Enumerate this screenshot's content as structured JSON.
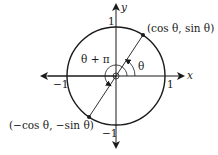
{
  "diagram": {
    "type": "unit-circle",
    "axes": {
      "x_label": "x",
      "y_label": "y"
    },
    "ticks": {
      "x_pos": "1",
      "x_neg": "−1",
      "y_pos": "1",
      "y_neg": "−1"
    },
    "points": {
      "p1": "(cos θ, sin θ)",
      "p2": "(−cos θ, −sin θ)"
    },
    "angles": {
      "theta": "θ",
      "theta_plus_pi": "θ + π"
    },
    "colors": {
      "stroke": "#1a1a1a",
      "background": "#ffffff"
    }
  }
}
